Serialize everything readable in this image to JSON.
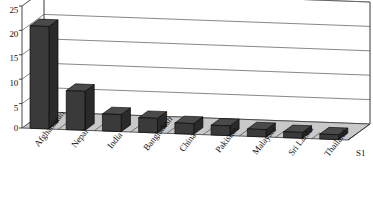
{
  "chart_data": {
    "type": "bar",
    "title": "",
    "subtitle": "",
    "xlabel": "",
    "ylabel": "",
    "categories": [
      "Afghanistan",
      "Nepal",
      "India",
      "Bangladesh",
      "China",
      "Pakistan",
      "Malaysia",
      "Sri Lanka",
      "Thailand"
    ],
    "values": [
      21,
      8,
      3.5,
      3,
      2.2,
      2,
      1.5,
      1.2,
      1
    ],
    "series": [
      {
        "name": "S1",
        "values": [
          21,
          8,
          3.5,
          3,
          2.2,
          2,
          1.5,
          1.2,
          1
        ]
      }
    ],
    "ylim": [
      0,
      25
    ],
    "yticks": [
      0,
      5,
      10,
      15,
      20,
      25
    ],
    "ytick_labels": [
      "0",
      "5",
      "10",
      "15",
      "20",
      "25"
    ],
    "grid": true,
    "grid_axis": "y",
    "legend": [
      "S1"
    ],
    "legend_position": "right",
    "three_d": true,
    "annotations": []
  },
  "style": {
    "bar_front_color": "#3a3a3a",
    "bar_side_color": "#2a2a2a",
    "bar_top_color": "#4a4a4a",
    "bar_edge_color": "#000000",
    "floor_color": "#c9c9c9",
    "wall_color": "#ffffff",
    "grid_color": "#555555",
    "axis_color": "#333333",
    "text_color": "#111111"
  }
}
